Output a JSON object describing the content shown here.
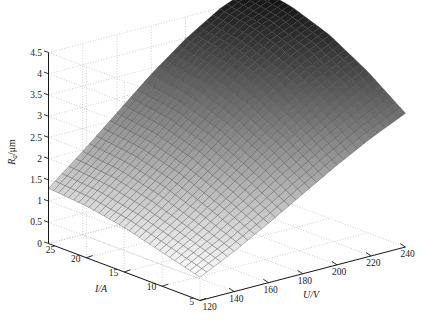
{
  "figure": {
    "kind": "3d-surface-plot",
    "background": "#ffffff",
    "surface_colormap": "gray",
    "mesh_edge_color": "#3a3a3a",
    "grid_color": "#b9b9b9",
    "axis_color": "#1a1a1a"
  },
  "axes": {
    "x": {
      "label": "U/V",
      "ticks": [
        120,
        140,
        160,
        180,
        200,
        220,
        240
      ],
      "tick_labels": [
        "120",
        "140",
        "160",
        "180",
        "200",
        "220",
        "240"
      ],
      "min": 120,
      "max": 240
    },
    "y": {
      "label": "I/A",
      "ticks": [
        25,
        20,
        15,
        10,
        5
      ],
      "tick_labels": [
        "25",
        "20",
        "15",
        "10",
        "5"
      ],
      "min": 5,
      "max": 25
    },
    "z": {
      "label": "Ra/μm",
      "label_main": "R",
      "label_sub": "a",
      "label_unit": "/μm",
      "ticks": [
        0,
        0.5,
        1,
        1.5,
        2,
        2.5,
        3,
        3.5,
        4,
        4.5
      ],
      "tick_labels": [
        "0",
        "0.5",
        "1",
        "1.5",
        "2",
        "2.5",
        "3",
        "3.5",
        "4",
        "4.5"
      ],
      "min": 0,
      "max": 4.5
    }
  },
  "chart_data": {
    "type": "surface",
    "title": "",
    "xlabel": "U/V",
    "ylabel": "I/A",
    "zlabel": "Ra/μm",
    "xlim": [
      120,
      240
    ],
    "ylim": [
      5,
      25
    ],
    "zlim": [
      0,
      4.5
    ],
    "grid": true,
    "legend": "none",
    "x": [
      120,
      140,
      160,
      180,
      200,
      220,
      240
    ],
    "y": [
      5,
      10,
      15,
      20,
      25
    ],
    "z_rows_note": "rows indexed by y (I/A) from 5 to 25, columns by x (U/V) from 120 to 240",
    "z": [
      [
        0.55,
        0.95,
        1.4,
        1.88,
        2.35,
        2.78,
        3.15
      ],
      [
        0.8,
        1.3,
        1.85,
        2.42,
        2.95,
        3.42,
        3.8
      ],
      [
        1.05,
        1.62,
        2.25,
        2.88,
        3.45,
        3.95,
        4.32
      ],
      [
        1.22,
        1.85,
        2.52,
        3.2,
        3.8,
        4.3,
        4.65
      ],
      [
        1.3,
        1.96,
        2.66,
        3.36,
        3.98,
        4.48,
        4.82
      ]
    ],
    "colorbar": false,
    "view": {
      "azimuth": -37.5,
      "elevation": 30
    }
  }
}
